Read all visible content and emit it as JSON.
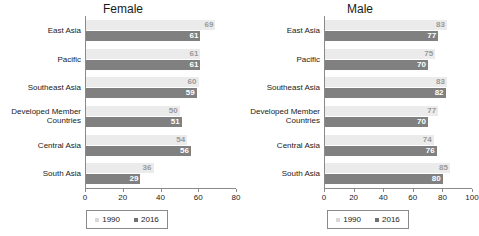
{
  "chart_data": [
    {
      "type": "bar",
      "title": "Female",
      "orientation": "horizontal",
      "xlabel": "",
      "ylabel": "",
      "xlim": [
        0,
        80
      ],
      "xticks": [
        0,
        20,
        40,
        60,
        80
      ],
      "grid": false,
      "legend_position": "bottom",
      "categories": [
        "East Asia",
        "Pacific",
        "Southeast Asia",
        "Developed Member\nCountries",
        "Central Asia",
        "South Asia"
      ],
      "series": [
        {
          "name": "1990",
          "color": "#ebebeb",
          "values": [
            69,
            61,
            60,
            50,
            54,
            36
          ]
        },
        {
          "name": "2016",
          "color": "#808080",
          "values": [
            61,
            61,
            59,
            51,
            56,
            29
          ]
        }
      ]
    },
    {
      "type": "bar",
      "title": "Male",
      "orientation": "horizontal",
      "xlabel": "",
      "ylabel": "",
      "xlim": [
        0,
        100
      ],
      "xticks": [
        0,
        20,
        40,
        60,
        80,
        100
      ],
      "grid": false,
      "legend_position": "bottom",
      "categories": [
        "East Asia",
        "Pacific",
        "Southeast Asia",
        "Developed Member\nCountries",
        "Central Asia",
        "South Asia"
      ],
      "series": [
        {
          "name": "1990",
          "color": "#ebebeb",
          "values": [
            83,
            75,
            83,
            77,
            74,
            85
          ]
        },
        {
          "name": "2016",
          "color": "#808080",
          "values": [
            77,
            70,
            82,
            70,
            76,
            80
          ]
        }
      ]
    }
  ]
}
